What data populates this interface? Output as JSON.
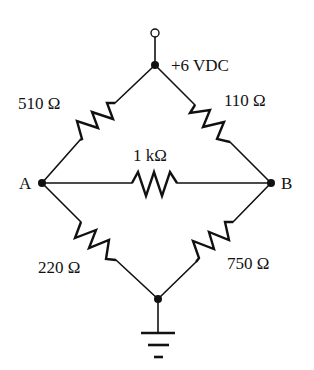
{
  "diagram": {
    "type": "Wheatstone bridge circuit",
    "supply": {
      "label": "+6 VDC",
      "terminal": "open-circle",
      "top_node": "supply-node"
    },
    "nodes": {
      "a": {
        "label": "A"
      },
      "b": {
        "label": "B"
      },
      "bottom": {
        "label": ""
      }
    },
    "resistors": {
      "top_left": {
        "label": "510 Ω",
        "value_ohms": 510,
        "between": [
          "supply",
          "A"
        ]
      },
      "top_right": {
        "label": "110 Ω",
        "value_ohms": 110,
        "between": [
          "supply",
          "B"
        ]
      },
      "bridge": {
        "label": "1 kΩ",
        "value_ohms": 1000,
        "between": [
          "A",
          "B"
        ]
      },
      "bottom_left": {
        "label": "220 Ω",
        "value_ohms": 220,
        "between": [
          "A",
          "ground"
        ]
      },
      "bottom_right": {
        "label": "750 Ω",
        "value_ohms": 750,
        "between": [
          "B",
          "ground"
        ]
      }
    },
    "ground": {
      "symbol": "ground"
    },
    "colors": {
      "line": "#111111",
      "background": "#ffffff"
    }
  }
}
